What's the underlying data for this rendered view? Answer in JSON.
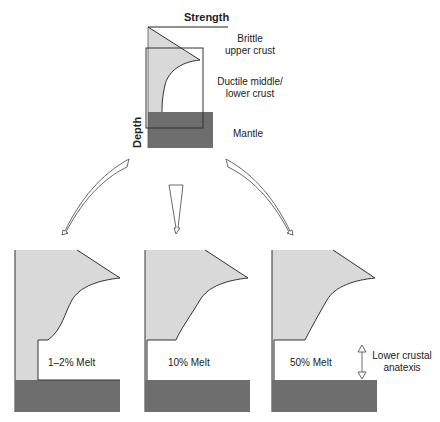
{
  "top_diagram": {
    "axis_x_label": "Strength",
    "axis_y_label": "Depth",
    "layers": [
      {
        "line1": "Brittle",
        "line2": "upper crust"
      },
      {
        "line1": "Ductile middle/",
        "line2": "lower crust"
      },
      {
        "line1": "Mantle"
      }
    ]
  },
  "panels": [
    {
      "label": "1–2% Melt"
    },
    {
      "label": "10% Melt"
    },
    {
      "label": "50% Melt"
    }
  ],
  "annotation": {
    "line1": "Lower crustal",
    "line2": "anatexis"
  },
  "colors": {
    "crust_fill": "#d9d9d9",
    "mantle_fill": "#6e6e6e",
    "stroke": "#333333"
  }
}
